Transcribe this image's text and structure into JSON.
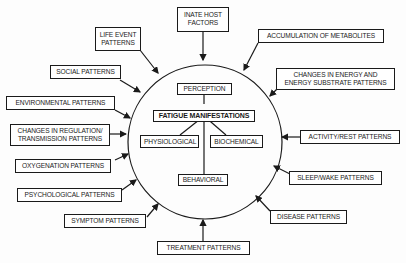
{
  "diagram": {
    "center": {
      "title": "FATIGUE MANIFESTATIONS",
      "nodes": {
        "perception": "PERCEPTION",
        "physiological": "PHYSIOLOGICAL",
        "biochemical": "BIOCHEMICAL",
        "behavioral": "BEHAVIORAL"
      }
    },
    "factors": {
      "innate_host_1": "INATE HOST",
      "innate_host_2": "FACTORS",
      "life_event_1": "LIFE EVENT",
      "life_event_2": "PATTERNS",
      "social": "SOCIAL PATTERNS",
      "environmental": "ENVIRONMENTAL PATTERNS",
      "regulation_1": "CHANGES IN REGULATION/",
      "regulation_2": "TRANSMISSION PATTERNS",
      "oxygenation": "OXYGENATION PATTERNS",
      "psychological": "PSYCHOLOGICAL PATTERNS",
      "symptom": "SYMPTOM PATTERNS",
      "treatment": "TREATMENT PATTERNS",
      "disease": "DISEASE PATTERNS",
      "sleep_wake": "SLEEP/WAKE PATTERNS",
      "activity_rest": "ACTIVITY/REST PATTERNS",
      "energy_1": "CHANGES IN ENERGY AND",
      "energy_2": "ENERGY SUBSTRATE PATTERNS",
      "metabolites": "ACCUMULATION OF METABOLITES"
    }
  }
}
